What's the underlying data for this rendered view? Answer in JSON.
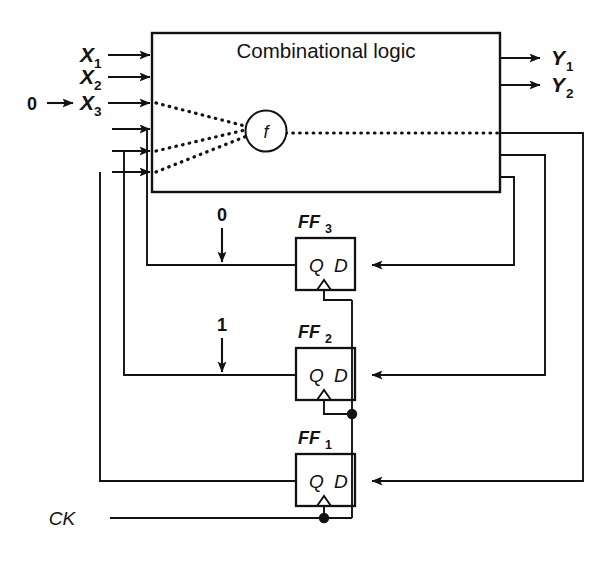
{
  "diagram": {
    "combinational_block": {
      "label": "Combinational logic",
      "function_node": "f"
    },
    "inputs": [
      {
        "name": "X1",
        "base": "X",
        "sub": "1",
        "value": ""
      },
      {
        "name": "X2",
        "base": "X",
        "sub": "2",
        "value": ""
      },
      {
        "name": "X3",
        "base": "X",
        "sub": "3",
        "value": "0"
      }
    ],
    "input_value_prefix": "0",
    "outputs": [
      {
        "name": "Y1",
        "base": "Y",
        "sub": "1"
      },
      {
        "name": "Y2",
        "base": "Y",
        "sub": "2"
      }
    ],
    "flipflops": [
      {
        "name": "FF3",
        "base": "FF",
        "sub": "3",
        "q_label": "Q",
        "d_label": "D",
        "state_value": "0"
      },
      {
        "name": "FF2",
        "base": "FF",
        "sub": "2",
        "q_label": "Q",
        "d_label": "D",
        "state_value": "1"
      },
      {
        "name": "FF1",
        "base": "FF",
        "sub": "1",
        "q_label": "Q",
        "d_label": "D",
        "state_value": ""
      }
    ],
    "clock": {
      "label": "CK"
    },
    "colors": {
      "ink": "#121212",
      "paper": "#ffffff"
    }
  }
}
